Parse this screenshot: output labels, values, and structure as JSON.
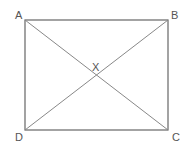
{
  "diagram": {
    "type": "rectangle-with-diagonals",
    "vertices": [
      {
        "label": "A",
        "x": 25,
        "y": 20
      },
      {
        "label": "B",
        "x": 168,
        "y": 20
      },
      {
        "label": "C",
        "x": 168,
        "y": 130
      },
      {
        "label": "D",
        "x": 25,
        "y": 130
      }
    ],
    "intersection": {
      "label": "X",
      "x": 96,
      "y": 75
    },
    "colors": {
      "edge": "#666666",
      "diagonal": "#888888",
      "label": "#555555"
    }
  }
}
